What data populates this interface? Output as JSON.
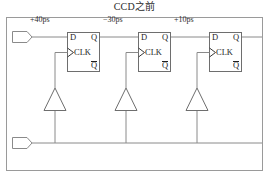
{
  "title": "CCD之前",
  "colors": {
    "frame": "#9a9a9a",
    "wire": "#8a8a8a",
    "block_border": "#6e6e6e",
    "text": "#2b2b2b",
    "background": "#ffffff"
  },
  "frame": {
    "x": 6,
    "y": 17,
    "width": 257,
    "height": 154
  },
  "ports": [
    {
      "name": "data-input-port",
      "label": "",
      "x": 12,
      "y": 32
    },
    {
      "name": "clock-input-port",
      "label": "",
      "x": 12,
      "y": 139
    }
  ],
  "delay_labels": [
    {
      "text": "+40ps",
      "x": 30,
      "y": 16
    },
    {
      "text": "−30ps",
      "x": 103,
      "y": 16
    },
    {
      "text": "+10ps",
      "x": 174,
      "y": 16
    }
  ],
  "flipflops": [
    {
      "name": "flipflop-1",
      "x": 67,
      "y": 32,
      "width": 33,
      "height": 40,
      "pins": {
        "d": "D",
        "q": "Q",
        "clk": "CLK",
        "qbar": "Q"
      }
    },
    {
      "name": "flipflop-2",
      "x": 138,
      "y": 32,
      "width": 33,
      "height": 40,
      "pins": {
        "d": "D",
        "q": "Q",
        "clk": "CLK",
        "qbar": "Q"
      }
    },
    {
      "name": "flipflop-3",
      "x": 209,
      "y": 32,
      "width": 33,
      "height": 40,
      "pins": {
        "d": "D",
        "q": "Q",
        "clk": "CLK",
        "qbar": "Q"
      }
    }
  ],
  "buffers": [
    {
      "name": "clock-buffer-1",
      "cx": 55,
      "top": 88,
      "bottom": 110,
      "half_width": 11
    },
    {
      "name": "clock-buffer-2",
      "cx": 126,
      "top": 88,
      "bottom": 110,
      "half_width": 11
    },
    {
      "name": "clock-buffer-3",
      "cx": 197,
      "top": 88,
      "bottom": 110,
      "half_width": 11
    }
  ],
  "rails": {
    "data_y": 37,
    "clock_y": 143
  }
}
